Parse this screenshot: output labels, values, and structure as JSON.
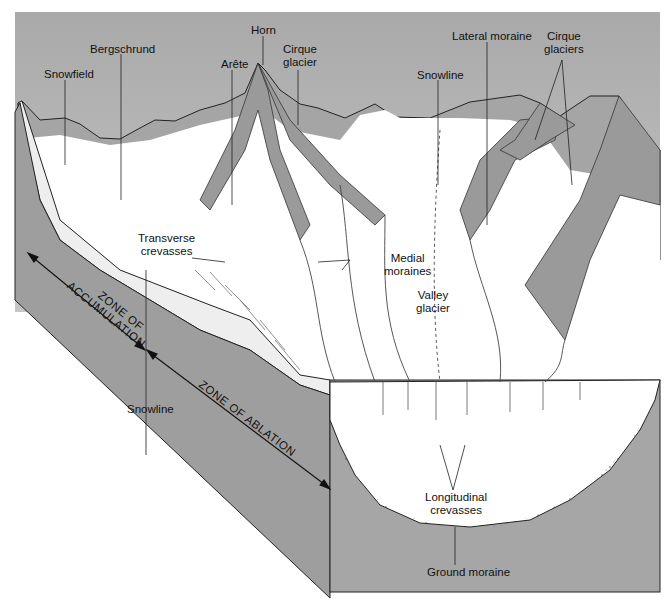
{
  "diagram": {
    "colors": {
      "sky": "#b4b4b4",
      "rock": "#9e9e9e",
      "rock_dark": "#8a8a8a",
      "ice": "#ffffff",
      "lines": "#222222"
    },
    "labels": {
      "snowfield": "Snowfield",
      "bergschrund": "Bergschrund",
      "arete": "Arête",
      "horn": "Horn",
      "cirque_glacier_1": "Cirque",
      "cirque_glacier_2": "glacier",
      "snowline_top": "Snowline",
      "lateral_moraine": "Lateral moraine",
      "cirque_glaciers_1": "Cirque",
      "cirque_glaciers_2": "glaciers",
      "transverse_crevasses_1": "Transverse",
      "transverse_crevasses_2": "crevasses",
      "medial_moraines_1": "Medial",
      "medial_moraines_2": "moraines",
      "valley_glacier_1": "Valley",
      "valley_glacier_2": "glacier",
      "zone_accumulation_1": "ZONE OF",
      "zone_accumulation_2": "ACCUMULATION",
      "snowline_side": "Snowline",
      "zone_ablation": "ZONE OF ABLATION",
      "longitudinal_crevasses_1": "Longitudinal",
      "longitudinal_crevasses_2": "crevasses",
      "ground_moraine": "Ground moraine"
    }
  }
}
